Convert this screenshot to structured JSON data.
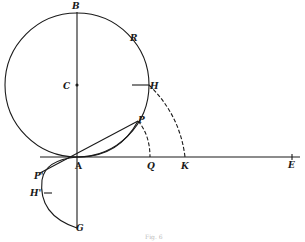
{
  "figure": {
    "caption": "Fig. 6",
    "ink_color": "#1a1a1a",
    "points": {
      "B": "B",
      "R": "R",
      "C": "C",
      "H": "H",
      "P": "P",
      "A": "A",
      "Q": "Q",
      "K": "K",
      "E": "E",
      "P_prime": "P'",
      "H_prime": "H'",
      "G": "G"
    }
  }
}
